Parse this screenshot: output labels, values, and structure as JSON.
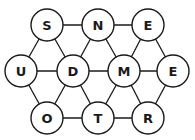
{
  "puzzle": {
    "type": "hexagonal letter grid",
    "colors": {
      "background": "#ffffff",
      "stroke": "#1a1a1a",
      "text": "#1a1a1a",
      "node_fill": "#ffffff"
    },
    "node_radius": 16,
    "nodes": [
      {
        "id": "n0",
        "letter": "S",
        "x": 47,
        "y": 25
      },
      {
        "id": "n1",
        "letter": "N",
        "x": 98,
        "y": 25
      },
      {
        "id": "n2",
        "letter": "E",
        "x": 148,
        "y": 25
      },
      {
        "id": "n3",
        "letter": "U",
        "x": 21,
        "y": 71
      },
      {
        "id": "n4",
        "letter": "D",
        "x": 73,
        "y": 71
      },
      {
        "id": "n5",
        "letter": "M",
        "x": 124,
        "y": 71
      },
      {
        "id": "n6",
        "letter": "E",
        "x": 173,
        "y": 71
      },
      {
        "id": "n7",
        "letter": "O",
        "x": 47,
        "y": 118
      },
      {
        "id": "n8",
        "letter": "T",
        "x": 98,
        "y": 118
      },
      {
        "id": "n9",
        "letter": "R",
        "x": 148,
        "y": 118
      }
    ],
    "edges": [
      [
        "n0",
        "n1"
      ],
      [
        "n1",
        "n2"
      ],
      [
        "n0",
        "n3"
      ],
      [
        "n0",
        "n4"
      ],
      [
        "n1",
        "n4"
      ],
      [
        "n1",
        "n5"
      ],
      [
        "n2",
        "n5"
      ],
      [
        "n2",
        "n6"
      ],
      [
        "n3",
        "n4"
      ],
      [
        "n4",
        "n5"
      ],
      [
        "n5",
        "n6"
      ],
      [
        "n3",
        "n7"
      ],
      [
        "n4",
        "n7"
      ],
      [
        "n4",
        "n8"
      ],
      [
        "n5",
        "n8"
      ],
      [
        "n5",
        "n9"
      ],
      [
        "n6",
        "n9"
      ],
      [
        "n7",
        "n8"
      ],
      [
        "n8",
        "n9"
      ]
    ]
  }
}
